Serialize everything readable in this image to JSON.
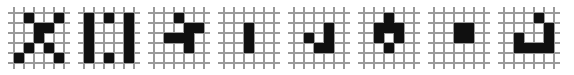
{
  "figure": {
    "type": "pattern-strip",
    "panel_count": 8,
    "grid_rows": 5,
    "grid_cols": 5,
    "colors": {
      "cell_on": "#101010",
      "cell_off": "#ffffff",
      "grid_line": "#9a9a9a",
      "background": "#ffffff"
    }
  },
  "patterns": [
    {
      "name": "pattern-1-x-shape",
      "label": "X",
      "grid": [
        [
          0,
          1,
          0,
          0,
          1
        ],
        [
          0,
          0,
          1,
          1,
          0
        ],
        [
          0,
          0,
          1,
          0,
          0
        ],
        [
          0,
          1,
          0,
          1,
          0
        ],
        [
          1,
          0,
          0,
          0,
          1
        ]
      ]
    },
    {
      "name": "pattern-2-double-bar",
      "label": "II",
      "grid": [
        [
          1,
          0,
          1,
          0,
          1
        ],
        [
          1,
          0,
          0,
          0,
          1
        ],
        [
          1,
          0,
          0,
          0,
          1
        ],
        [
          1,
          0,
          0,
          0,
          1
        ],
        [
          1,
          0,
          1,
          0,
          1
        ]
      ]
    },
    {
      "name": "pattern-3-arrow",
      "label": "arrow",
      "grid": [
        [
          0,
          0,
          1,
          0,
          0
        ],
        [
          0,
          0,
          0,
          1,
          1
        ],
        [
          0,
          1,
          1,
          1,
          0
        ],
        [
          0,
          0,
          0,
          1,
          0
        ],
        [
          0,
          0,
          0,
          0,
          0
        ]
      ]
    },
    {
      "name": "pattern-4-vertical-bar",
      "label": "I",
      "grid": [
        [
          0,
          0,
          0,
          0,
          0
        ],
        [
          0,
          0,
          1,
          0,
          0
        ],
        [
          0,
          0,
          1,
          0,
          0
        ],
        [
          0,
          0,
          1,
          0,
          0
        ],
        [
          0,
          0,
          0,
          0,
          0
        ]
      ]
    },
    {
      "name": "pattern-5-hook",
      "label": "J",
      "grid": [
        [
          0,
          0,
          0,
          0,
          0
        ],
        [
          0,
          0,
          0,
          1,
          0
        ],
        [
          0,
          1,
          0,
          1,
          0
        ],
        [
          0,
          0,
          1,
          1,
          0
        ],
        [
          0,
          0,
          0,
          0,
          0
        ]
      ]
    },
    {
      "name": "pattern-6-ring",
      "label": "o",
      "grid": [
        [
          0,
          0,
          1,
          0,
          0
        ],
        [
          0,
          1,
          1,
          1,
          0
        ],
        [
          0,
          1,
          0,
          1,
          0
        ],
        [
          0,
          0,
          1,
          0,
          0
        ],
        [
          0,
          0,
          0,
          0,
          0
        ]
      ]
    },
    {
      "name": "pattern-7-block",
      "label": "block",
      "grid": [
        [
          0,
          0,
          0,
          0,
          0
        ],
        [
          0,
          0,
          1,
          1,
          0
        ],
        [
          0,
          0,
          1,
          1,
          0
        ],
        [
          0,
          0,
          0,
          0,
          0
        ],
        [
          0,
          0,
          0,
          0,
          0
        ]
      ]
    },
    {
      "name": "pattern-8-u-shape",
      "label": "U",
      "grid": [
        [
          0,
          0,
          0,
          1,
          0
        ],
        [
          0,
          0,
          0,
          0,
          1
        ],
        [
          0,
          1,
          0,
          0,
          1
        ],
        [
          0,
          1,
          1,
          1,
          1
        ],
        [
          0,
          0,
          0,
          0,
          0
        ]
      ]
    }
  ]
}
